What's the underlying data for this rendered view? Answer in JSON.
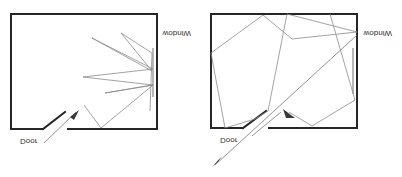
{
  "figure": {
    "colors": {
      "wall": "#262626",
      "ray": "#8c8c8c",
      "window": "#a8a8a8",
      "arrowhead": "#3a3a3a"
    }
  },
  "panels": [
    {
      "name": "left-room",
      "labels": {
        "door": "Door",
        "window": "Window"
      },
      "walls": "M11,129 L43,129 M43,129 L65,112 M68,129 L157,129 L157,14 L11,14 L11,129",
      "window_line": "M153,48 L153,97",
      "rays": "M84,105 L101,128 L153,85 L105,93 L153,85 L83,77 L153,69 L92,38 L152,71 L121,33 L152,53 L150,111",
      "arrow_line": "M44,143 L76,112",
      "arrowhead": "M70,117 L79,110 L74,120 Z",
      "door_label_pos": [
        20,
        137
      ],
      "window_label_pos": [
        163,
        35
      ]
    },
    {
      "name": "right-room",
      "labels": {
        "door": "Door",
        "window": "Window"
      },
      "walls": "M211,128 L243,128 M243,128 L266,111 M269,128 L357,128 L357,14 L211,14 L211,128",
      "window_line": "M353,48 L353,94",
      "rays": "M225,128 L211,53 L263,15 L292,39 L357,32 L287,14 L268,111 L255,119 L225,128 M330,14 L355,100 L312,126 L289,112",
      "secondary_ray": "M357,35 L215,165",
      "door_pass_line": "M252,136 L281,112",
      "arrowhead_in": "M283,109 L295,118 L286,118 Z",
      "arrowhead_out": "M212,167 L222,156 L218,162 Z",
      "door_label_pos": [
        220,
        134
      ],
      "window_label_pos": [
        364,
        35
      ]
    }
  ]
}
